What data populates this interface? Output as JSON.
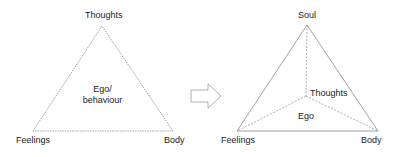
{
  "left_diagram": {
    "top_label": "Thoughts",
    "left_label": "Feelings",
    "right_label": "Body",
    "center_label_line1": "Ego/",
    "center_label_line2": "behaviour"
  },
  "arrow": {
    "icon": "right-arrow-icon"
  },
  "right_diagram": {
    "top_label": "Soul",
    "inner_label": "Thoughts",
    "center_label": "Ego",
    "left_label": "Feelings",
    "right_label": "Body"
  },
  "colors": {
    "line": "#8a8a8a",
    "text": "#222222"
  }
}
